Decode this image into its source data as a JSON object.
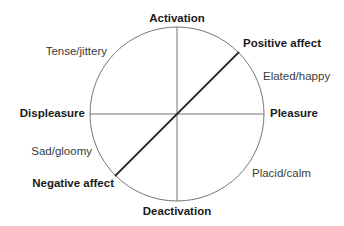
{
  "diagram": {
    "type": "circumplex-model-of-affect",
    "axes": {
      "top": "Activation",
      "bottom": "Deactivation",
      "left": "Displeasure",
      "right": "Pleasure"
    },
    "diagonal": {
      "upper_right": "Positive affect",
      "lower_left": "Negative affect"
    },
    "quadrant_states": {
      "upper_left": "Tense/jittery",
      "upper_right": "Elated/happy",
      "lower_left": "Sad/gloomy",
      "lower_right": "Placid/calm"
    },
    "colors": {
      "axis_line": "#777777",
      "circle": "#777777",
      "diagonal": "#2a2a2a",
      "bold_text": "#1a1a1a",
      "regular_text": "#3a3a3a"
    }
  }
}
